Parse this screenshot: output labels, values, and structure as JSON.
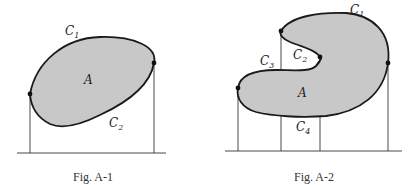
{
  "figures": [
    {
      "id": "fig-a1",
      "caption": "Fig. A-1",
      "region_label": "A",
      "curve_labels": [
        {
          "name": "C",
          "sub": "1"
        },
        {
          "name": "C",
          "sub": "2"
        }
      ]
    },
    {
      "id": "fig-a2",
      "caption": "Fig. A-2",
      "region_label": "A",
      "curve_labels": [
        {
          "name": "C",
          "sub": "1"
        },
        {
          "name": "C",
          "sub": "2"
        },
        {
          "name": "C",
          "sub": "3"
        },
        {
          "name": "C",
          "sub": "4"
        }
      ]
    }
  ],
  "colors": {
    "region_fill": "#c8c8c8",
    "outline": "#1a1a1a"
  }
}
